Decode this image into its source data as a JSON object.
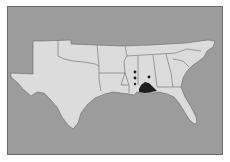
{
  "map": {
    "type": "range-map",
    "region": "Southern United States",
    "colors": {
      "water_background": "#9c9c9c",
      "land": "#dcdcdc",
      "border": "#6a6a6a",
      "range_fill": "#1e1e1e",
      "occurrence_dot": "#1e1e1e"
    },
    "states_shown": [
      "Texas",
      "Oklahoma",
      "Arkansas",
      "Louisiana",
      "Mississippi",
      "Alabama",
      "Georgia",
      "Florida",
      "Tennessee",
      "South Carolina",
      "North Carolina"
    ],
    "occurrence_points": [
      {
        "x": 134,
        "y": 71
      },
      {
        "x": 134,
        "y": 77
      },
      {
        "x": 148,
        "y": 76
      },
      {
        "x": 134,
        "y": 84
      }
    ],
    "range_area": "Gulf coast of Mississippi / Alabama"
  }
}
